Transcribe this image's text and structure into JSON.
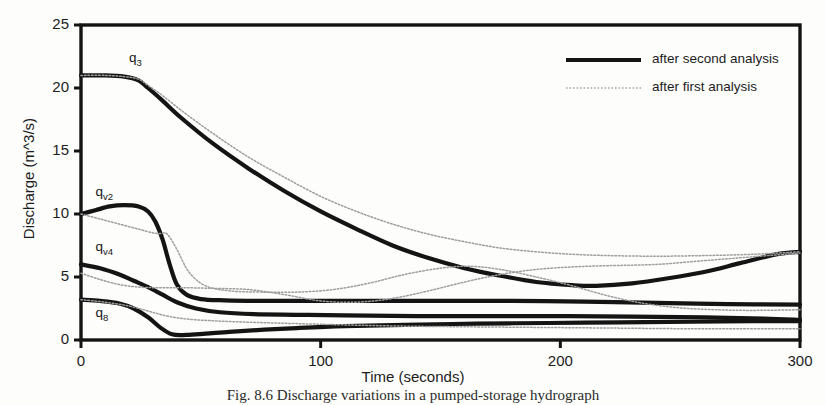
{
  "figure": {
    "caption": "Fig. 8.6 Discharge variations in a pumped-storage hydrograph"
  },
  "chart_data": {
    "type": "line",
    "title": "",
    "xlabel": "Time (seconds)",
    "ylabel": "Discharge (m^3/s)",
    "xlim": [
      0,
      300
    ],
    "ylim": [
      0,
      25
    ],
    "xticks": [
      0,
      100,
      200,
      300
    ],
    "yticks": [
      0,
      5,
      10,
      15,
      20,
      25
    ],
    "grid": false,
    "legend_position": "upper-right-inside",
    "legend": [
      {
        "name": "after second analysis",
        "style": "solid-thick",
        "color": "#141414"
      },
      {
        "name": "after first analysis",
        "style": "dotted-thin",
        "color": "#9a9a9a"
      }
    ],
    "annotations": [
      {
        "text": "q",
        "sub": "3",
        "x": 20,
        "y": 22.3
      },
      {
        "text": "q",
        "sub": "v2",
        "x": 6,
        "y": 11.7
      },
      {
        "text": "q",
        "sub": "v4",
        "x": 6,
        "y": 7.3
      },
      {
        "text": "q",
        "sub": "8",
        "x": 6,
        "y": 2.1
      }
    ],
    "series": [
      {
        "name": "q3 after second analysis",
        "curve": "q3",
        "analysis": "second",
        "style": "solid-thick",
        "x": [
          0,
          10,
          18,
          24,
          28,
          34,
          42,
          55,
          70,
          85,
          100,
          115,
          130,
          145,
          160,
          175,
          190,
          205,
          215,
          230,
          245,
          260,
          275,
          290,
          300
        ],
        "y": [
          21.0,
          21.0,
          20.9,
          20.6,
          20.0,
          19.0,
          17.6,
          15.6,
          13.6,
          11.8,
          10.2,
          8.8,
          7.5,
          6.5,
          5.7,
          5.1,
          4.6,
          4.35,
          4.3,
          4.5,
          4.9,
          5.4,
          6.1,
          6.8,
          7.0
        ]
      },
      {
        "name": "q3 after first analysis",
        "curve": "q3",
        "analysis": "first",
        "style": "dotted-thin",
        "x": [
          0,
          10,
          18,
          24,
          28,
          34,
          42,
          55,
          70,
          85,
          100,
          115,
          130,
          145,
          160,
          175,
          190,
          205,
          220,
          240,
          260,
          280,
          300
        ],
        "y": [
          21.0,
          21.0,
          20.9,
          20.7,
          20.2,
          19.4,
          18.2,
          16.4,
          14.5,
          12.9,
          11.4,
          10.2,
          9.2,
          8.4,
          7.8,
          7.3,
          7.0,
          6.8,
          6.7,
          6.65,
          6.7,
          6.8,
          7.0
        ]
      },
      {
        "name": "qv2 after second analysis",
        "curve": "qv2",
        "analysis": "second",
        "style": "solid-thick",
        "x": [
          0,
          6,
          12,
          18,
          24,
          28,
          31,
          34,
          37,
          40,
          44,
          50,
          60,
          75,
          95,
          120,
          150,
          180,
          210,
          240,
          270,
          300
        ],
        "y": [
          10.0,
          10.3,
          10.6,
          10.7,
          10.6,
          10.2,
          9.4,
          8.0,
          6.0,
          4.4,
          3.6,
          3.25,
          3.15,
          3.1,
          3.1,
          3.1,
          3.1,
          3.1,
          3.05,
          2.95,
          2.85,
          2.8
        ]
      },
      {
        "name": "qv2 after first analysis",
        "curve": "qv2",
        "analysis": "first",
        "style": "dotted-thin",
        "x": [
          0,
          8,
          16,
          24,
          30,
          33,
          36,
          40,
          45,
          52,
          62,
          75,
          90,
          105,
          120,
          135,
          150,
          162,
          175,
          190,
          205,
          220,
          235,
          250,
          265,
          280,
          300
        ],
        "y": [
          10.0,
          9.6,
          9.2,
          8.8,
          8.5,
          8.45,
          8.4,
          7.2,
          5.4,
          4.3,
          3.9,
          3.8,
          3.8,
          4.0,
          4.5,
          5.2,
          5.7,
          5.85,
          5.6,
          5.0,
          4.3,
          3.5,
          2.9,
          2.55,
          2.4,
          2.35,
          2.4
        ]
      },
      {
        "name": "qv4 after second analysis",
        "curve": "qv4",
        "analysis": "second",
        "style": "solid-thick",
        "x": [
          0,
          8,
          16,
          22,
          28,
          34,
          40,
          48,
          58,
          72,
          90,
          110,
          140,
          170,
          200,
          230,
          260,
          285,
          300
        ],
        "y": [
          6.0,
          5.7,
          5.2,
          4.7,
          4.2,
          3.6,
          3.0,
          2.5,
          2.2,
          2.05,
          2.0,
          1.95,
          1.9,
          1.9,
          1.9,
          1.85,
          1.8,
          1.7,
          1.6
        ]
      },
      {
        "name": "qv4 after first analysis",
        "curve": "qv4",
        "analysis": "first",
        "style": "dotted-thin",
        "x": [
          0,
          8,
          16,
          24,
          32,
          42,
          55,
          70,
          85,
          100,
          115,
          130,
          145,
          160,
          175,
          190,
          205,
          220,
          240,
          260,
          280,
          300
        ],
        "y": [
          5.3,
          4.8,
          4.4,
          4.2,
          4.15,
          4.15,
          4.1,
          4.0,
          3.6,
          3.1,
          3.0,
          3.3,
          3.9,
          4.6,
          5.2,
          5.6,
          5.8,
          5.9,
          6.0,
          6.3,
          6.6,
          6.9
        ]
      },
      {
        "name": "q8 after second analysis",
        "curve": "q8",
        "analysis": "second",
        "style": "solid-thick",
        "x": [
          0,
          8,
          16,
          22,
          28,
          33,
          38,
          44,
          52,
          62,
          75,
          90,
          110,
          135,
          165,
          195,
          225,
          255,
          280,
          300
        ],
        "y": [
          3.2,
          3.1,
          2.9,
          2.5,
          1.8,
          1.0,
          0.45,
          0.4,
          0.5,
          0.65,
          0.8,
          0.95,
          1.1,
          1.2,
          1.3,
          1.35,
          1.4,
          1.45,
          1.5,
          1.5
        ]
      },
      {
        "name": "q8 after first analysis",
        "curve": "q8",
        "analysis": "first",
        "style": "dotted-thin",
        "x": [
          0,
          10,
          20,
          28,
          36,
          45,
          58,
          72,
          90,
          110,
          135,
          160,
          190,
          220,
          250,
          275,
          300
        ],
        "y": [
          3.2,
          3.0,
          2.7,
          2.3,
          1.9,
          1.65,
          1.5,
          1.4,
          1.3,
          1.2,
          1.1,
          1.05,
          1.0,
          0.95,
          0.9,
          0.9,
          0.9
        ]
      }
    ]
  }
}
